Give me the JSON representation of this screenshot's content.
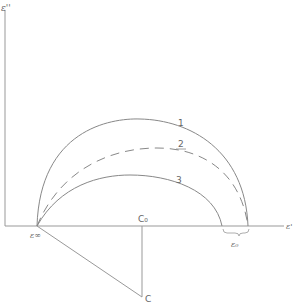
{
  "diagram": {
    "type": "cole-cole-plot",
    "axes": {
      "y_label": "ε''",
      "x_label": "ε'"
    },
    "points": {
      "eps_inf": "ε∞",
      "c0_top": "C₀",
      "c_bottom": "C",
      "eps0": "ε₀"
    },
    "curves": [
      {
        "label": "1",
        "style": "solid"
      },
      {
        "label": "2",
        "style": "dashed"
      },
      {
        "label": "3",
        "style": "solid"
      }
    ],
    "colors": {
      "line": "#888888",
      "text": "#666666"
    }
  }
}
